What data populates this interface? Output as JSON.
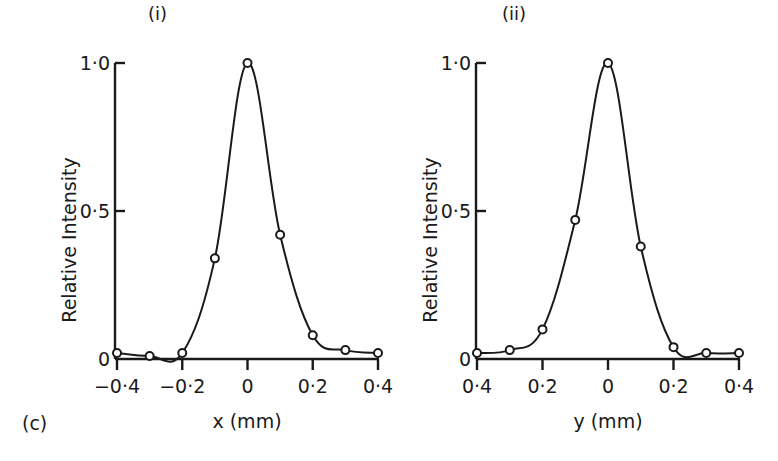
{
  "figure_label": "(c)",
  "colors": {
    "ink": "#1a1a1a",
    "background": "#ffffff"
  },
  "chart_data": [
    {
      "type": "line",
      "panel_label": "(i)",
      "title": "",
      "xlabel": "x (mm)",
      "ylabel": "Relative Intensity",
      "xlim": [
        -0.4,
        0.4
      ],
      "ylim": [
        0,
        1.0
      ],
      "x_ticks": [
        -0.4,
        -0.2,
        0,
        0.2,
        0.4
      ],
      "x_tick_labels": [
        "−0·4",
        "−0·2",
        "0",
        "0·2",
        "0·4"
      ],
      "y_ticks": [
        0,
        0.5,
        1.0
      ],
      "y_tick_labels": [
        "0",
        "0·5",
        "1·0"
      ],
      "grid": false,
      "markers": "open-circle",
      "x": [
        -0.4,
        -0.3,
        -0.2,
        -0.1,
        0.0,
        0.1,
        0.2,
        0.3,
        0.4
      ],
      "values": [
        0.02,
        0.01,
        0.02,
        0.34,
        1.0,
        0.42,
        0.08,
        0.03,
        0.02
      ]
    },
    {
      "type": "line",
      "panel_label": "(ii)",
      "title": "",
      "xlabel": "y (mm)",
      "ylabel": "Relative Intensity",
      "xlim": [
        -0.4,
        0.4
      ],
      "ylim": [
        0,
        1.0
      ],
      "x_ticks": [
        -0.4,
        -0.2,
        0,
        0.2,
        0.4
      ],
      "x_tick_labels": [
        "0·4",
        "0·2",
        "0",
        "0·2",
        "0·4"
      ],
      "y_ticks": [
        0,
        0.5,
        1.0
      ],
      "y_tick_labels": [
        "0",
        "0·5",
        "1·0"
      ],
      "grid": false,
      "markers": "open-circle",
      "x": [
        -0.4,
        -0.3,
        -0.2,
        -0.1,
        0.0,
        0.1,
        0.2,
        0.3,
        0.4
      ],
      "values": [
        0.02,
        0.03,
        0.1,
        0.47,
        1.0,
        0.38,
        0.04,
        0.02,
        0.02
      ]
    }
  ]
}
